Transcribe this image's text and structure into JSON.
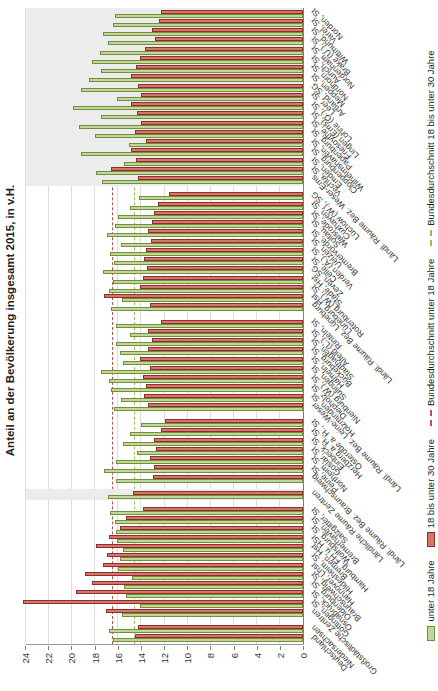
{
  "title": "Anteil an der Bevölkerung insgesamt 2015, in v.H.",
  "colors": {
    "bar_under18_fill": "#c2d69a",
    "bar_under18_border": "#70903c",
    "bar_18to30_fill": "#d6756b",
    "bar_18to30_border": "#8e2f28",
    "ref_under18": "#c0504d",
    "ref_18to30": "#9bbb59",
    "band_shade": "#ececec",
    "gridline": "#dcdcdc"
  },
  "legend": [
    {
      "label": "unter 18 Jahre",
      "marker": "box-green"
    },
    {
      "label": "18 bis unter 30 Jahre",
      "marker": "box-red"
    },
    {
      "label": "Bundesdurchschnitt  unter 18 Jahre",
      "marker": "dash-red"
    },
    {
      "label": "Bundesdurchschnitt 18 bis unter 30 Jahre",
      "marker": "dash-green"
    }
  ],
  "chart_data": {
    "type": "bar",
    "orientation": "rotated-90-ccw",
    "title": "Anteil an der Bevölkerung insgesamt 2015, in v.H.",
    "ylabel": "Anteil an der Bevölkerung insgesamt 2015, in v.H.",
    "xlabel": "",
    "ylim": [
      0,
      24
    ],
    "ytick_step": 2,
    "yticks": [
      0,
      2,
      4,
      6,
      8,
      10,
      12,
      14,
      16,
      18,
      20,
      22,
      24
    ],
    "grid": true,
    "legend_position": "bottom",
    "series_names": [
      "unter 18 Jahre",
      "18 bis unter 30 Jahre"
    ],
    "reference_lines": [
      {
        "name": "Bundesdurchschnitt  unter 18 Jahre",
        "value": 16.5,
        "style": "dashed-red"
      },
      {
        "name": "Bundesdurchschnitt 18 bis unter 30 Jahre",
        "value": 14.6,
        "style": "dashed-green"
      }
    ],
    "groups": [
      {
        "shaded": false,
        "items": [
          {
            "label": "Deutschland",
            "unter_18": 16.5,
            "v18_30": 14.6
          },
          {
            "label": "Niedersachsen",
            "unter_18": 16.8,
            "v18_30": 14.3
          }
        ]
      },
      {
        "shaded": false,
        "items": [
          {
            "label": "Großstädtische Zentren",
            "unter_18": 15.7,
            "v18_30": 17.1
          },
          {
            "label": "Göttingen, St",
            "unter_18": 14.1,
            "v18_30": 24.3
          },
          {
            "label": "Osnabrück, St",
            "unter_18": 15.3,
            "v18_30": 19.7
          },
          {
            "label": "Oldenburg, St",
            "unter_18": 15.5,
            "v18_30": 18.3
          },
          {
            "label": "Braunschweig, St",
            "unter_18": 14.8,
            "v18_30": 18.9
          },
          {
            "label": "Hannover, Lhst",
            "unter_18": 16.0,
            "v18_30": 17.3
          },
          {
            "label": "Hildesheim, St",
            "unter_18": 15.9,
            "v18_30": 17.0
          },
          {
            "label": "Bremen, Hst",
            "unter_18": 15.6,
            "v18_30": 17.9
          },
          {
            "label": "Hamburg, FH u. HSt",
            "unter_18": 16.1,
            "v18_30": 16.8
          },
          {
            "label": "Wolfsburg, St",
            "unter_18": 16.2,
            "v18_30": 15.9
          },
          {
            "label": "Bremerhaven, St",
            "unter_18": 16.3,
            "v18_30": 15.3
          },
          {
            "label": "Salzgitter, St",
            "unter_18": 16.7,
            "v18_30": 13.9
          }
        ]
      },
      {
        "shaded": true,
        "items": [
          {
            "label": "Ländliche Räume Zentren",
            "unter_18": 16.9,
            "v18_30": 14.7
          }
        ]
      },
      {
        "shaded": false,
        "items": [
          {
            "label": "Ländl. Räume Bez. Braunschweig",
            "unter_18": 16.2,
            "v18_30": 13.0
          },
          {
            "label": "Peine, St",
            "unter_18": 17.2,
            "v18_30": 12.9
          },
          {
            "label": "Northeim, St",
            "unter_18": 16.2,
            "v18_30": 13.3
          },
          {
            "label": "Goslar, St",
            "unter_18": 14.4,
            "v18_30": 12.7
          },
          {
            "label": "Einbeck, St",
            "unter_18": 15.6,
            "v18_30": 12.9
          },
          {
            "label": "Herzberg a. H., St",
            "unter_18": 15.0,
            "v18_30": 12.3
          },
          {
            "label": "Osterode a. H., St",
            "unter_18": 14.0,
            "v18_30": 12.0
          }
        ]
      },
      {
        "shaded": false,
        "items": [
          {
            "label": "Ländl. Räume Bez. Leine-Weser",
            "unter_18": 16.4,
            "v18_30": 13.4
          },
          {
            "label": "Holzminden, St",
            "unter_18": 15.8,
            "v18_30": 13.8
          },
          {
            "label": "Diepholz, St",
            "unter_18": 16.6,
            "v18_30": 13.6
          },
          {
            "label": "Nienburg (W.), St",
            "unter_18": 16.8,
            "v18_30": 13.9
          },
          {
            "label": "Sulingen, St",
            "unter_18": 17.5,
            "v18_30": 13.3
          },
          {
            "label": "Hameln, St",
            "unter_18": 15.6,
            "v18_30": 14.1
          },
          {
            "label": "Bückeburg, St",
            "unter_18": 15.9,
            "v18_30": 13.4
          },
          {
            "label": "Stadthagen, St",
            "unter_18": 16.2,
            "v18_30": 13.1
          },
          {
            "label": "Alfeld (L.), St",
            "unter_18": 15.0,
            "v18_30": 13.4
          },
          {
            "label": "Rinteln, St",
            "unter_18": 16.2,
            "v18_30": 12.3
          }
        ]
      },
      {
        "shaded": false,
        "items": [
          {
            "label": "Ländl. Räume Bez. Lüneburg",
            "unter_18": 16.6,
            "v18_30": 13.3
          },
          {
            "label": "Lüneburg, Hst",
            "unter_18": 15.7,
            "v18_30": 17.2
          },
          {
            "label": "Rotenburg (W.), St",
            "unter_18": 16.8,
            "v18_30": 14.1
          },
          {
            "label": "Stade, Hst",
            "unter_18": 16.5,
            "v18_30": 13.9
          },
          {
            "label": "Zeven, SG",
            "unter_18": 17.3,
            "v18_30": 13.5
          },
          {
            "label": "Celle, St",
            "unter_18": 16.4,
            "v18_30": 13.8
          },
          {
            "label": "Verden (A.), St",
            "unter_18": 16.7,
            "v18_30": 13.6
          },
          {
            "label": "Uelzen, St",
            "unter_18": 15.8,
            "v18_30": 13.2
          },
          {
            "label": "Bremervörde, St",
            "unter_18": 17.0,
            "v18_30": 13.4
          },
          {
            "label": "Soltau, St",
            "unter_18": 16.3,
            "v18_30": 13.1
          },
          {
            "label": "Walsrode, St",
            "unter_18": 16.0,
            "v18_30": 12.9
          },
          {
            "label": "Cuxhaven, St",
            "unter_18": 15.0,
            "v18_30": 12.6
          },
          {
            "label": "Lüchow (W.), SG",
            "unter_18": 14.2,
            "v18_30": 11.6
          }
        ]
      },
      {
        "shaded": true,
        "items": [
          {
            "label": "Ländl. Räume Bez. Weser-Ems",
            "unter_18": 17.4,
            "v18_30": 14.3
          },
          {
            "label": "Vechta, St",
            "unter_18": 17.9,
            "v18_30": 16.6
          },
          {
            "label": "Emden, St",
            "unter_18": 15.5,
            "v18_30": 14.5
          },
          {
            "label": "Cloppenburg, St",
            "unter_18": 19.2,
            "v18_30": 14.9
          },
          {
            "label": "Wilhelmshaven, St",
            "unter_18": 15.1,
            "v18_30": 13.6
          },
          {
            "label": "Papenburg, St",
            "unter_18": 18.0,
            "v18_30": 14.6
          },
          {
            "label": "Friesoythe, St",
            "unter_18": 19.4,
            "v18_30": 14.0
          },
          {
            "label": "Lingen (Ems), St",
            "unter_18": 17.5,
            "v18_30": 14.4
          },
          {
            "label": "Lohne (O.), St",
            "unter_18": 19.9,
            "v18_30": 14.9
          },
          {
            "label": "Leer, St",
            "unter_18": 16.1,
            "v18_30": 14.0
          },
          {
            "label": "Artland, SG",
            "unter_18": 19.2,
            "v18_30": 14.3
          },
          {
            "label": "Meppen, St",
            "unter_18": 18.5,
            "v18_30": 14.9
          },
          {
            "label": "Nordhorn, St",
            "unter_18": 17.5,
            "v18_30": 14.5
          },
          {
            "label": "Aurich, St",
            "unter_18": 18.3,
            "v18_30": 14.1
          },
          {
            "label": "Nordenham, St",
            "unter_18": 17.6,
            "v18_30": 13.7
          },
          {
            "label": "Brake (U.), St",
            "unter_18": 16.9,
            "v18_30": 12.8
          },
          {
            "label": "Wittmund, St",
            "unter_18": 17.3,
            "v18_30": 13.1
          },
          {
            "label": "Varel, St",
            "unter_18": 16.5,
            "v18_30": 12.5
          },
          {
            "label": "Norden, St",
            "unter_18": 16.3,
            "v18_30": 12.3
          }
        ]
      }
    ]
  }
}
